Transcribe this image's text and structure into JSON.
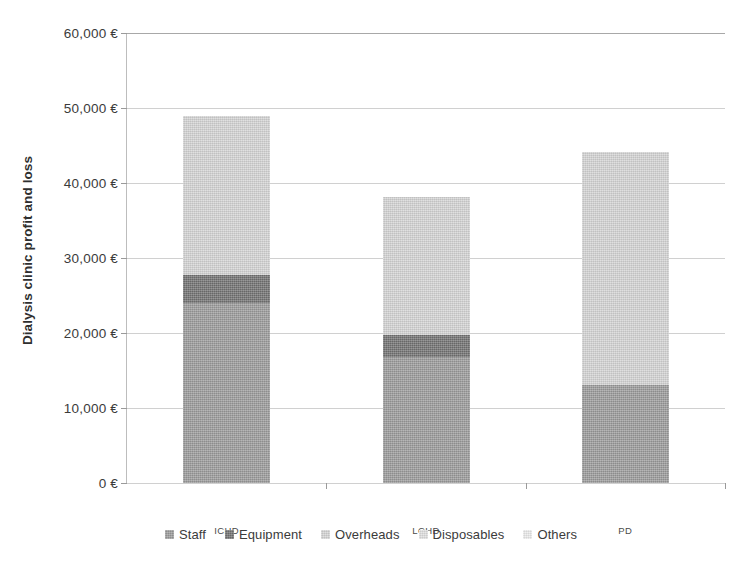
{
  "chart_data": {
    "type": "bar",
    "stacked": true,
    "title": "",
    "xlabel": "",
    "ylabel": "Dialysis clinic profit and loss",
    "categories": [
      "ICHD",
      "LCHD",
      "PD"
    ],
    "series": [
      {
        "name": "Staff",
        "color": "#9b9b9b",
        "values": [
          24000,
          16800,
          13100
        ]
      },
      {
        "name": "Equipment",
        "color": "#727272",
        "values": [
          3700,
          2900,
          0
        ]
      },
      {
        "name": "Overheads",
        "color": "#d4d4d4",
        "values": [
          21300,
          18500,
          31100
        ]
      },
      {
        "name": "Disposables",
        "color": "#e0e0e0",
        "values": [
          0,
          0,
          0
        ]
      },
      {
        "name": "Others",
        "color": "#ebebeb",
        "values": [
          0,
          0,
          0
        ]
      }
    ],
    "totals": [
      49000,
      38200,
      44200
    ],
    "ylim": [
      0,
      60000
    ],
    "ytick_values": [
      0,
      10000,
      20000,
      30000,
      40000,
      50000,
      60000
    ],
    "ytick_labels": [
      "0 €",
      "10,000 €",
      "20,000 €",
      "30,000 €",
      "40,000 €",
      "50,000 €",
      "60,000 €"
    ],
    "grid": true,
    "legend_position": "bottom",
    "currency": "€"
  },
  "axis": {
    "y_title": "Dialysis clinic profit and loss"
  },
  "legend": {
    "items": [
      {
        "label": "Staff"
      },
      {
        "label": "Equipment"
      },
      {
        "label": "Overheads"
      },
      {
        "label": "Disposables"
      },
      {
        "label": "Others"
      }
    ]
  }
}
